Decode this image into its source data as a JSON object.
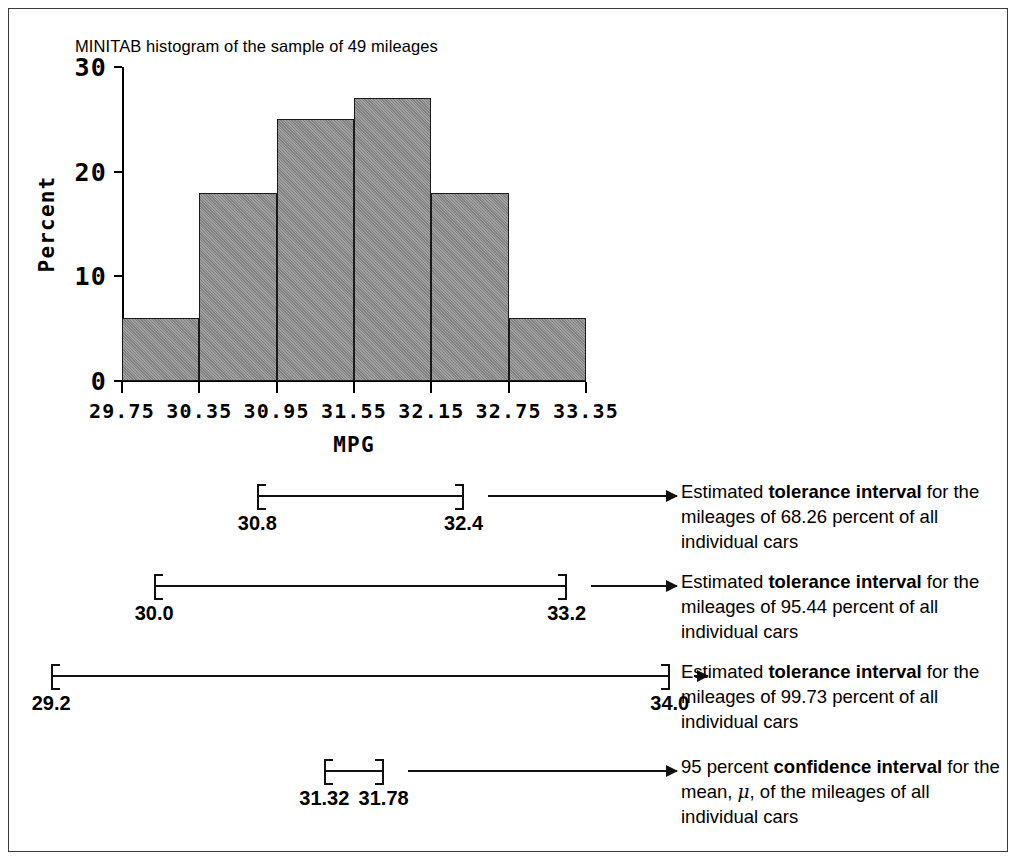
{
  "chart_data": {
    "type": "bar",
    "title": "MINITAB histogram of the sample of 49 mileages",
    "xlabel": "MPG",
    "ylabel": "Percent",
    "ylim": [
      0,
      30
    ],
    "yticks": [
      "0",
      "10",
      "20",
      "30"
    ],
    "ytick_values": [
      0,
      10,
      20,
      30
    ],
    "xticks": [
      "29.75",
      "30.35",
      "30.95",
      "31.55",
      "32.15",
      "32.75",
      "33.35"
    ],
    "xtick_values": [
      29.75,
      30.35,
      30.95,
      31.55,
      32.15,
      32.75,
      33.35
    ],
    "bin_edges": [
      29.75,
      30.35,
      30.95,
      31.55,
      32.15,
      32.75,
      33.35
    ],
    "categories": [
      "29.75-30.35",
      "30.35-30.95",
      "30.95-31.55",
      "31.55-32.15",
      "32.15-32.75",
      "32.75-33.35"
    ],
    "values": [
      6,
      18,
      25,
      27,
      18,
      6
    ],
    "grid": false,
    "legend": false,
    "bar_color": "#8d8d8d",
    "bar_edge_color": "#1a1a1a"
  },
  "intervals": [
    {
      "id": "tolerance-68",
      "lower": "30.8",
      "upper": "32.4",
      "lower_value": 30.8,
      "upper_value": 32.4,
      "caption_pre": "Estimated ",
      "caption_bold": "tolerance interval",
      "caption_post": " for the mileages of 68.26 percent of all individual cars",
      "percent": "68.26"
    },
    {
      "id": "tolerance-95",
      "lower": "30.0",
      "upper": "33.2",
      "lower_value": 30.0,
      "upper_value": 33.2,
      "caption_pre": "Estimated ",
      "caption_bold": "tolerance interval",
      "caption_post": " for the mileages of 95.44 percent of all individual cars",
      "percent": "95.44"
    },
    {
      "id": "tolerance-99",
      "lower": "29.2",
      "upper": "34.0",
      "lower_value": 29.2,
      "upper_value": 34.0,
      "caption_pre": "Estimated ",
      "caption_bold": "tolerance interval",
      "caption_post": " for the mileages of 99.73 percent of all individual cars",
      "percent": "99.73"
    },
    {
      "id": "confidence-95",
      "lower": "31.32",
      "upper": "31.78",
      "lower_value": 31.32,
      "upper_value": 31.78,
      "caption_pre": "95 percent ",
      "caption_bold": "confidence interval",
      "caption_post": " for the mean, μ, of the mileages of all individual cars",
      "percent": "95"
    }
  ]
}
